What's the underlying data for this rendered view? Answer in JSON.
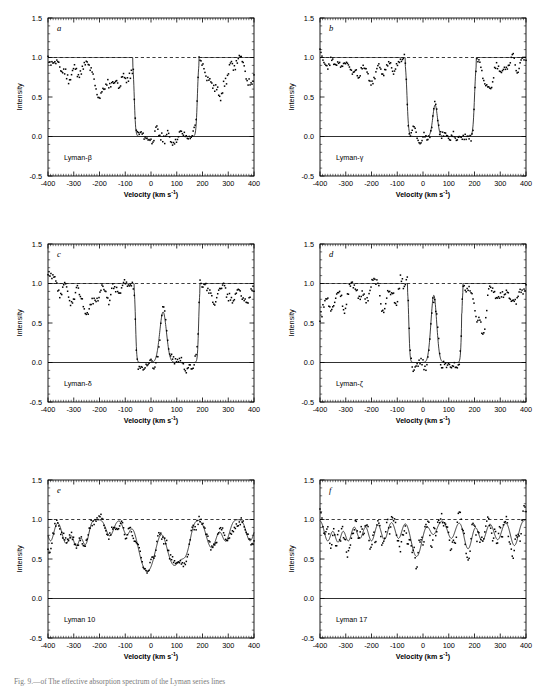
{
  "figure": {
    "caption": "Fig. 9.—of The effective absorption spectrum of the Lyman series lines",
    "panel_label_style": "italic-letter",
    "axis": {
      "xlabel": "Velocity (km s",
      "xlabel_sup": "-1",
      "xlabel_tail": ")",
      "ylabel": "Intensity",
      "xticks": [
        -400,
        -300,
        -200,
        -100,
        0,
        100,
        200,
        300,
        400
      ],
      "xticklabels": [
        "-400",
        "-300",
        "-200",
        "-100",
        "0",
        "100",
        "200",
        "300",
        "400"
      ],
      "yticks": [
        -0.5,
        0.0,
        0.5,
        1.0,
        1.5
      ],
      "yticklabels": [
        "-0.5",
        "0.0",
        "0.5",
        "1.0",
        "1.5"
      ],
      "xlim": [
        -400,
        400
      ],
      "ylim": [
        -0.5,
        1.5
      ],
      "minor_x_count": 10,
      "minor_y_count": 5,
      "continuum_level": 1.0,
      "zero_level": 0.0
    },
    "colors": {
      "ink": "#000000",
      "model": "#1a1a1a",
      "background": "#ffffff"
    },
    "panels": [
      {
        "id": "a",
        "label": "a",
        "line_name": "Lyman-β",
        "saturation": {
          "left": -65,
          "right": 180,
          "edge": 6
        },
        "emission": [],
        "noise": {
          "seed": 11,
          "amp": 0.085,
          "scale": 0.78
        },
        "absorbers": [
          {
            "center": -355,
            "depth": 0.18,
            "width": 14
          },
          {
            "center": -315,
            "depth": 0.3,
            "width": 16
          },
          {
            "center": -270,
            "depth": 0.22,
            "width": 14
          },
          {
            "center": -205,
            "depth": 0.62,
            "width": 22
          },
          {
            "center": -165,
            "depth": 0.33,
            "width": 18
          },
          {
            "center": -120,
            "depth": 0.38,
            "width": 20
          },
          {
            "center": -80,
            "depth": 0.3,
            "width": 14
          },
          {
            "center": 255,
            "depth": 0.6,
            "width": 26
          },
          {
            "center": 300,
            "depth": 0.18,
            "width": 16
          },
          {
            "center": 380,
            "depth": 0.35,
            "width": 18
          }
        ]
      },
      {
        "id": "b",
        "label": "b",
        "line_name": "Lyman-γ",
        "saturation": {
          "left": -62,
          "right": 200,
          "edge": 7
        },
        "emission": [
          {
            "center": 47,
            "height": 0.4,
            "width": 9
          }
        ],
        "noise": {
          "seed": 23,
          "amp": 0.075,
          "scale": 0.72
        },
        "absorbers": [
          {
            "center": -380,
            "depth": 0.12,
            "width": 12
          },
          {
            "center": -330,
            "depth": 0.2,
            "width": 16
          },
          {
            "center": -270,
            "depth": 0.24,
            "width": 16
          },
          {
            "center": -230,
            "depth": 0.2,
            "width": 14
          },
          {
            "center": -195,
            "depth": 0.38,
            "width": 16
          },
          {
            "center": -150,
            "depth": 0.22,
            "width": 16
          },
          {
            "center": -115,
            "depth": 0.16,
            "width": 12
          },
          {
            "center": 255,
            "depth": 0.36,
            "width": 18
          },
          {
            "center": 310,
            "depth": 0.16,
            "width": 16
          },
          {
            "center": 370,
            "depth": 0.14,
            "width": 14
          }
        ]
      },
      {
        "id": "c",
        "label": "c",
        "line_name": "Lyman-δ",
        "saturation": {
          "left": -60,
          "right": 185,
          "edge": 5
        },
        "emission": [
          {
            "center": 47,
            "height": 0.64,
            "width": 13
          }
        ],
        "noise": {
          "seed": 37,
          "amp": 0.09,
          "scale": 0.7
        },
        "absorbers": [
          {
            "center": -350,
            "depth": 0.2,
            "width": 14
          },
          {
            "center": -305,
            "depth": 0.34,
            "width": 16
          },
          {
            "center": -250,
            "depth": 0.44,
            "width": 14
          },
          {
            "center": -215,
            "depth": 0.22,
            "width": 16
          },
          {
            "center": -170,
            "depth": 0.18,
            "width": 14
          },
          {
            "center": -120,
            "depth": 0.16,
            "width": 12
          },
          {
            "center": 240,
            "depth": 0.18,
            "width": 16
          },
          {
            "center": 300,
            "depth": 0.22,
            "width": 16
          },
          {
            "center": 370,
            "depth": 0.26,
            "width": 18
          }
        ]
      },
      {
        "id": "d",
        "label": "d",
        "line_name": "Lyman-ζ",
        "saturation": {
          "left": -55,
          "right": 150,
          "edge": 5
        },
        "emission": [
          {
            "center": 42,
            "height": 0.85,
            "width": 11
          }
        ],
        "noise": {
          "seed": 53,
          "amp": 0.1,
          "scale": 0.66
        },
        "step": {
          "x": 150,
          "level": 0.62,
          "x2": 195
        },
        "absorbers": [
          {
            "center": -395,
            "depth": 0.5,
            "width": 12
          },
          {
            "center": -355,
            "depth": 0.28,
            "width": 14
          },
          {
            "center": -300,
            "depth": 0.42,
            "width": 12
          },
          {
            "center": -230,
            "depth": 0.24,
            "width": 14
          },
          {
            "center": -150,
            "depth": 0.46,
            "width": 14
          },
          {
            "center": -110,
            "depth": 0.22,
            "width": 14
          },
          {
            "center": 225,
            "depth": 0.95,
            "width": 18
          },
          {
            "center": 300,
            "depth": 0.3,
            "width": 18
          },
          {
            "center": 355,
            "depth": 0.34,
            "width": 16
          }
        ]
      },
      {
        "id": "e",
        "label": "e",
        "line_name": "Lyman 10",
        "saturation": null,
        "emission": [],
        "noise": {
          "seed": 71,
          "amp": 0.075,
          "scale": 0.55
        },
        "absorbers": [
          {
            "center": -390,
            "depth": 0.3,
            "width": 12
          },
          {
            "center": -330,
            "depth": 0.34,
            "width": 14
          },
          {
            "center": -290,
            "depth": 0.38,
            "width": 12
          },
          {
            "center": -255,
            "depth": 0.36,
            "width": 12
          },
          {
            "center": -160,
            "depth": 0.22,
            "width": 14
          },
          {
            "center": -95,
            "depth": 0.2,
            "width": 12
          },
          {
            "center": -15,
            "depth": 1.02,
            "width": 26
          },
          {
            "center": 90,
            "depth": 0.82,
            "width": 24
          },
          {
            "center": 135,
            "depth": 0.45,
            "width": 16
          },
          {
            "center": 235,
            "depth": 0.42,
            "width": 18
          },
          {
            "center": 290,
            "depth": 0.3,
            "width": 14
          },
          {
            "center": 385,
            "depth": 0.3,
            "width": 14
          }
        ]
      },
      {
        "id": "f",
        "label": "f",
        "line_name": "Lyman 17",
        "saturation": null,
        "emission": [],
        "noise": {
          "seed": 97,
          "amp": 0.11,
          "scale": 0.42
        },
        "absorbers": [
          {
            "center": -370,
            "depth": 0.3,
            "width": 12
          },
          {
            "center": -330,
            "depth": 0.32,
            "width": 12
          },
          {
            "center": -290,
            "depth": 0.3,
            "width": 12
          },
          {
            "center": -245,
            "depth": 0.26,
            "width": 12
          },
          {
            "center": -200,
            "depth": 0.3,
            "width": 12
          },
          {
            "center": -150,
            "depth": 0.28,
            "width": 12
          },
          {
            "center": -95,
            "depth": 0.26,
            "width": 12
          },
          {
            "center": -25,
            "depth": 0.6,
            "width": 18
          },
          {
            "center": 40,
            "depth": 0.2,
            "width": 14
          },
          {
            "center": 110,
            "depth": 0.26,
            "width": 14
          },
          {
            "center": 175,
            "depth": 0.44,
            "width": 14
          },
          {
            "center": 230,
            "depth": 0.3,
            "width": 14
          },
          {
            "center": 290,
            "depth": 0.28,
            "width": 14
          },
          {
            "center": 355,
            "depth": 0.38,
            "width": 14
          }
        ]
      }
    ],
    "layout": {
      "cols": 2,
      "rows": 3,
      "panel_width": 272,
      "panel_height": 226,
      "plot_left": 48,
      "plot_top": 18,
      "plot_right": 254,
      "plot_bottom": 176
    }
  },
  "chart_data": {
    "type": "line",
    "title": "",
    "xlabel": "Velocity (km s-1)",
    "ylabel": "Intensity",
    "xlim": [
      -400,
      400
    ],
    "ylim": [
      -0.5,
      1.5
    ],
    "grid": false,
    "legend": "none",
    "series": [
      {
        "name": "Lyman-β",
        "panel": "a",
        "model_note": "saturated trough from -65 to 180 km/s, continuum 1.0"
      },
      {
        "name": "Lyman-γ",
        "panel": "b",
        "model_note": "saturated trough -62 to 200 km/s with emission spike at +47"
      },
      {
        "name": "Lyman-δ",
        "panel": "c",
        "model_note": "saturated trough -60 to 185 km/s, emission peak 0.64 at +47"
      },
      {
        "name": "Lyman-ζ",
        "panel": "d",
        "model_note": "trough -55 to 150 km/s, emission peak 0.85 at +42, step to 1.0 at 195"
      },
      {
        "name": "Lyman 10",
        "panel": "e",
        "model_note": "two deep troughs near -15 and +90 km/s"
      },
      {
        "name": "Lyman 17",
        "panel": "f",
        "model_note": "shallow blended absorption, continuum near 1.0"
      }
    ]
  }
}
